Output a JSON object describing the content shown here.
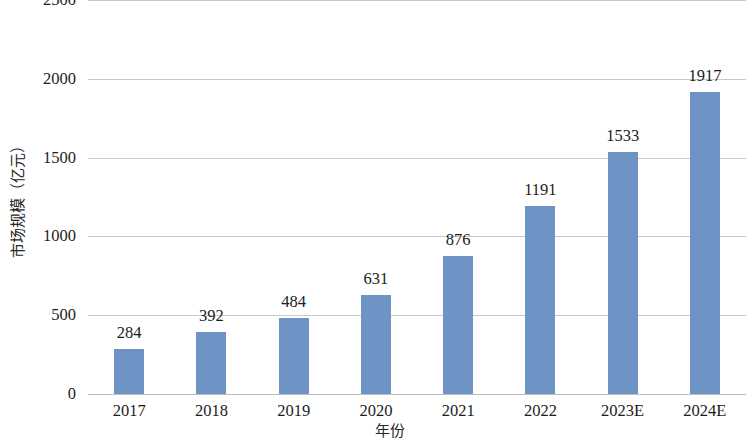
{
  "chart_data": {
    "type": "bar",
    "title": "",
    "subtitle": "",
    "xlabel": "年份",
    "ylabel": "市场规模（亿元）",
    "categories": [
      "2017",
      "2018",
      "2019",
      "2020",
      "2021",
      "2022",
      "2023E",
      "2024E"
    ],
    "values": [
      284,
      392,
      484,
      631,
      876,
      1191,
      1533,
      1917
    ],
    "data_labels": [
      "284",
      "392",
      "484",
      "631",
      "876",
      "1191",
      "1533",
      "1917"
    ],
    "ylim": [
      0,
      2500
    ],
    "y_ticks": [
      0,
      500,
      1000,
      1500,
      2000,
      2500
    ],
    "y_tick_labels": [
      "0",
      "500",
      "1000",
      "1500",
      "2000",
      "2500"
    ],
    "grid": true,
    "grid_axis": "y",
    "legend": false,
    "legend_position": "none",
    "series": [
      {
        "name": "市场规模（亿元）",
        "color": "#6d94c4",
        "values": [
          284,
          392,
          484,
          631,
          876,
          1191,
          1533,
          1917
        ]
      }
    ],
    "colors": {
      "bar": "#6d94c4",
      "gridline": "#c9c9c9",
      "text": "#1c1c1c",
      "background": "#ffffff"
    }
  }
}
